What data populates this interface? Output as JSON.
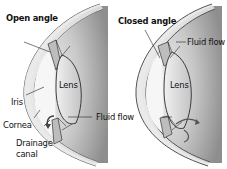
{
  "diagram": {
    "left_panel": {
      "title": "Open angle",
      "labels": {
        "lens": "Lens",
        "iris": "Iris",
        "cornea": "Cornea",
        "drainage_canal_line1": "Drainage",
        "drainage_canal_line2": "canal"
      }
    },
    "right_panel": {
      "title": "Closed angle",
      "labels": {
        "lens": "Lens",
        "fluid_flow_top": "Fluid flow"
      }
    },
    "shared": {
      "fluid_flow_middle": "Fluid flow"
    },
    "colors": {
      "background": "#ffffff",
      "eye_shading_dark": "#8a8a8a",
      "eye_shading_light": "#f2f2f2",
      "lens_fill": "#dcdcdc",
      "outline": "#2a2a2a"
    }
  }
}
